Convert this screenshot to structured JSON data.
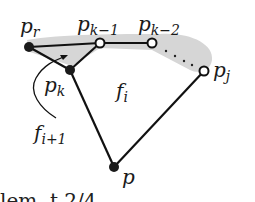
{
  "diagram": {
    "colors": {
      "stroke": "#111111",
      "shade": "#d6d6d6",
      "filled_point": "#1a1a1a",
      "open_point_fill": "#ffffff"
    },
    "points": {
      "p_r": {
        "main": "p",
        "sub": "r"
      },
      "p_k_minus_1": {
        "main": "p",
        "sub": "k−1"
      },
      "p_k_minus_2": {
        "main": "p",
        "sub": "k−2"
      },
      "p_j": {
        "main": "p",
        "sub": "j"
      },
      "p_k": {
        "main": "p",
        "sub": "k"
      },
      "p": {
        "main": "p"
      }
    },
    "faces": {
      "f_i": {
        "main": "f",
        "sub": "i"
      },
      "f_i_plus_1": {
        "main": "f",
        "sub": "i+1"
      }
    },
    "dotted_ellipsis": "· · ·",
    "cutoff_text": "lem..t 2/4"
  }
}
